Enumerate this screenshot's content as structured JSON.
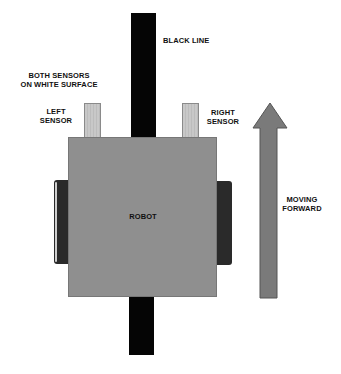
{
  "diagram": {
    "labels": {
      "black_line": "BLACK LINE",
      "status_line1": "BOTH SENSORS",
      "status_line2": "ON WHITE SURFACE",
      "left_sensor_line1": "LEFT",
      "left_sensor_line2": "SENSOR",
      "right_sensor_line1": "RIGHT",
      "right_sensor_line2": "SENSOR",
      "robot": "ROBOT",
      "direction_line1": "MOVING",
      "direction_line2": "FORWARD"
    },
    "colors": {
      "black_line": "#050505",
      "robot_body": "#8f8f8f",
      "sensor": "#c2c2c2",
      "wheel": "#2a2a2a",
      "arrow": "#7a7a7a"
    }
  }
}
